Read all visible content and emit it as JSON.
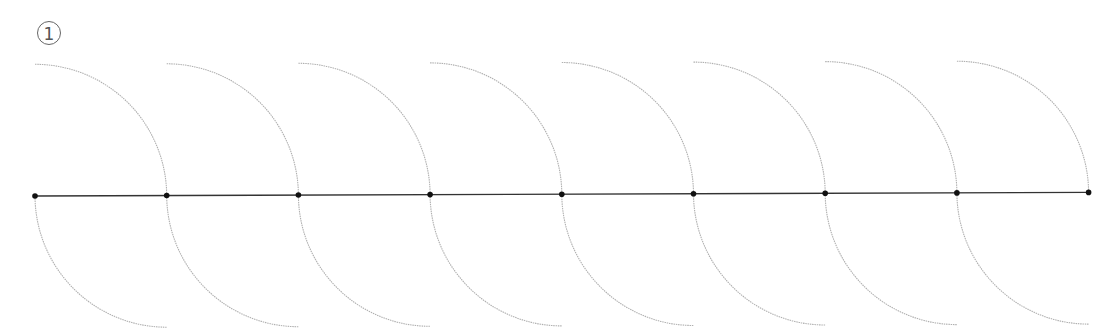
{
  "step_label": "1",
  "diagram": {
    "radius": 131.7,
    "line_color": "#333333",
    "arc_color": "#b0b0b0",
    "point_color": "#111111",
    "points": [
      [
        35,
        196
      ],
      [
        166.7,
        195.5
      ],
      [
        298.4,
        195
      ],
      [
        430.1,
        194.6
      ],
      [
        561.8,
        194.2
      ],
      [
        693.5,
        193.8
      ],
      [
        825.2,
        193.3
      ],
      [
        956.9,
        192.9
      ],
      [
        1088.6,
        192.4
      ]
    ]
  }
}
